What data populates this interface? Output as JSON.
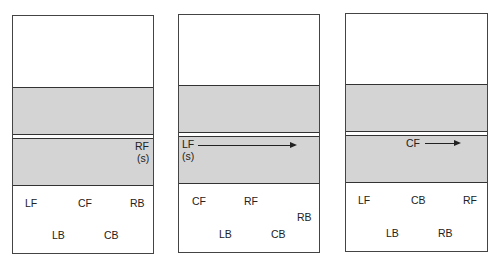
{
  "colors": {
    "band": "#d4d4d4",
    "border": "#444444",
    "text": "#222222"
  },
  "panels": [
    {
      "id": "panel-1",
      "box": {
        "left": 12,
        "top": 15,
        "width": 142,
        "height": 239
      },
      "bands": [
        {
          "top": 71,
          "height": 48
        },
        {
          "top": 122,
          "height": 48
        }
      ],
      "labels": [
        {
          "text": "RF",
          "x": 122,
          "y": 124
        },
        {
          "text": "(s)",
          "x": 124,
          "y": 136
        },
        {
          "text": "LF",
          "x": 12,
          "y": 181
        },
        {
          "text": "CF",
          "x": 65,
          "y": 181
        },
        {
          "text": "RB",
          "x": 117,
          "y": 181
        },
        {
          "text": "LB",
          "x": 39,
          "y": 213
        },
        {
          "text": "CB",
          "x": 91,
          "y": 213
        }
      ],
      "arrows": []
    },
    {
      "id": "panel-2",
      "box": {
        "left": 178,
        "top": 14,
        "width": 142,
        "height": 239
      },
      "bands": [
        {
          "top": 70,
          "height": 48
        },
        {
          "top": 121,
          "height": 48
        }
      ],
      "labels": [
        {
          "text": "LF",
          "x": 3,
          "y": 123
        },
        {
          "text": "(s)",
          "x": 3,
          "y": 135
        },
        {
          "text": "CF",
          "x": 13,
          "y": 180
        },
        {
          "text": "RF",
          "x": 65,
          "y": 180
        },
        {
          "text": "RB",
          "x": 118,
          "y": 196
        },
        {
          "text": "LB",
          "x": 40,
          "y": 213
        },
        {
          "text": "CB",
          "x": 92,
          "y": 213
        }
      ],
      "arrows": [
        {
          "x": 19,
          "y": 130,
          "width": 97
        }
      ]
    },
    {
      "id": "panel-3",
      "box": {
        "left": 345,
        "top": 13,
        "width": 143,
        "height": 239
      },
      "bands": [
        {
          "top": 70,
          "height": 48
        },
        {
          "top": 121,
          "height": 48
        }
      ],
      "labels": [
        {
          "text": "CF",
          "x": 60,
          "y": 123
        },
        {
          "text": "LF",
          "x": 12,
          "y": 180
        },
        {
          "text": "CB",
          "x": 65,
          "y": 180
        },
        {
          "text": "RF",
          "x": 117,
          "y": 180
        },
        {
          "text": "LB",
          "x": 40,
          "y": 213
        },
        {
          "text": "RB",
          "x": 92,
          "y": 213
        }
      ],
      "arrows": [
        {
          "x": 79,
          "y": 129,
          "width": 34
        }
      ]
    }
  ]
}
